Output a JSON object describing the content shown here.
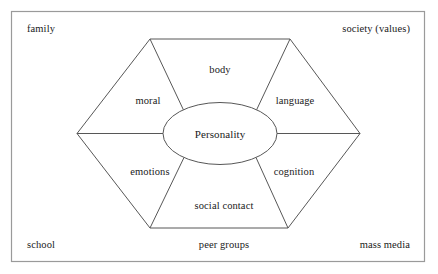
{
  "figure": {
    "kind": "personality-development-hexagon-diagram",
    "core": {
      "label": "Personality"
    },
    "sectors": [
      {
        "id": "body",
        "label": "body"
      },
      {
        "id": "language",
        "label": "language"
      },
      {
        "id": "cognition",
        "label": "cognition"
      },
      {
        "id": "social-contact",
        "label": "social contact"
      },
      {
        "id": "emotions",
        "label": "emotions"
      },
      {
        "id": "moral",
        "label": "moral"
      }
    ],
    "context_labels": [
      {
        "id": "family",
        "label": "family",
        "position": "top-left"
      },
      {
        "id": "society",
        "label": "society (values)",
        "position": "top-right"
      },
      {
        "id": "school",
        "label": "school",
        "position": "bottom-left"
      },
      {
        "id": "peer-groups",
        "label": "peer groups",
        "position": "bottom-center"
      },
      {
        "id": "mass-media",
        "label": "mass media",
        "position": "bottom-right"
      }
    ],
    "colors": {
      "stroke": "#555555",
      "frame": "#888888",
      "text": "#1a1a1a",
      "background": "#ffffff"
    }
  }
}
